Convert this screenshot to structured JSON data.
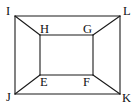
{
  "diagram": {
    "type": "geometry-figure",
    "points": {
      "I": {
        "x": 15,
        "y": 16
      },
      "L": {
        "x": 120,
        "y": 16
      },
      "K": {
        "x": 120,
        "y": 94
      },
      "J": {
        "x": 15,
        "y": 94
      },
      "H": {
        "x": 40,
        "y": 35
      },
      "G": {
        "x": 93,
        "y": 35
      },
      "F": {
        "x": 93,
        "y": 75
      },
      "E": {
        "x": 40,
        "y": 75
      }
    },
    "labels": [
      {
        "id": "I",
        "text": "I",
        "x": 6,
        "y": 15
      },
      {
        "id": "L",
        "text": "L",
        "x": 123,
        "y": 15
      },
      {
        "id": "H",
        "text": "H",
        "x": 40,
        "y": 33
      },
      {
        "id": "G",
        "text": "G",
        "x": 83,
        "y": 33
      },
      {
        "id": "E",
        "text": "E",
        "x": 40,
        "y": 86
      },
      {
        "id": "F",
        "text": "F",
        "x": 83,
        "y": 86
      },
      {
        "id": "J",
        "text": "J",
        "x": 6,
        "y": 101
      },
      {
        "id": "K",
        "text": "K",
        "x": 122,
        "y": 102
      }
    ],
    "segments": [
      [
        "I",
        "L"
      ],
      [
        "L",
        "K"
      ],
      [
        "K",
        "J"
      ],
      [
        "J",
        "I"
      ],
      [
        "H",
        "G"
      ],
      [
        "G",
        "F"
      ],
      [
        "F",
        "E"
      ],
      [
        "E",
        "H"
      ],
      [
        "I",
        "H"
      ],
      [
        "L",
        "G"
      ],
      [
        "K",
        "F"
      ],
      [
        "J",
        "E"
      ]
    ],
    "colors": {
      "stroke": "#1a1a1a",
      "label": "#111111",
      "background": "#ffffff"
    }
  }
}
